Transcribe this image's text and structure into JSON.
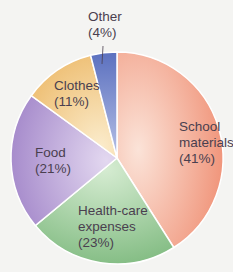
{
  "chart_data": {
    "type": "pie",
    "title": "",
    "categories": [
      "School materials",
      "Health-care expenses",
      "Food",
      "Clothes",
      "Other"
    ],
    "values": [
      41,
      23,
      21,
      11,
      4
    ],
    "unit": "%",
    "colors": [
      "#f0a088",
      "#9ccc9a",
      "#bba6d8",
      "#f2cc8a",
      "#6a7fc4"
    ],
    "labels": [
      {
        "line1": "School",
        "line2": "materials",
        "line3": "(41%)"
      },
      {
        "line1": "Health-care",
        "line2": "expenses",
        "line3": "(23%)"
      },
      {
        "line1": "Food",
        "line2": "(21%)"
      },
      {
        "line1": "Clothes",
        "line2": "(11%)"
      },
      {
        "line1": "Other",
        "line2": "(4%)"
      }
    ]
  }
}
